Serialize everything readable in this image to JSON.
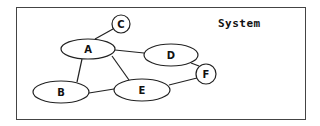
{
  "title": "System",
  "nodes": [
    {
      "id": "A",
      "label": "A",
      "shape": "ellipse",
      "cx": 88,
      "cy": 49,
      "rx": 27,
      "ry": 10
    },
    {
      "id": "B",
      "label": "B",
      "shape": "ellipse",
      "cx": 61,
      "cy": 92,
      "rx": 28,
      "ry": 11
    },
    {
      "id": "C",
      "label": "C",
      "shape": "circle",
      "cx": 121,
      "cy": 24,
      "r": 9
    },
    {
      "id": "D",
      "label": "D",
      "shape": "ellipse",
      "cx": 171,
      "cy": 55,
      "rx": 27,
      "ry": 11
    },
    {
      "id": "E",
      "label": "E",
      "shape": "ellipse",
      "cx": 142,
      "cy": 90,
      "rx": 28,
      "ry": 11
    },
    {
      "id": "F",
      "label": "F",
      "shape": "circle",
      "cx": 206,
      "cy": 74,
      "r": 10
    }
  ],
  "edges": [
    {
      "from": "A",
      "to": "C",
      "x1": 95,
      "y1": 39,
      "x2": 113,
      "y2": 29
    },
    {
      "from": "A",
      "to": "D",
      "x1": 115,
      "y1": 50,
      "x2": 144,
      "y2": 53
    },
    {
      "from": "A",
      "to": "B",
      "x1": 82,
      "y1": 59,
      "x2": 77,
      "y2": 82
    },
    {
      "from": "A",
      "to": "E",
      "x1": 112,
      "y1": 56,
      "x2": 129,
      "y2": 80
    },
    {
      "from": "B",
      "to": "E",
      "x1": 89,
      "y1": 93,
      "x2": 114,
      "y2": 89
    },
    {
      "from": "E",
      "to": "F",
      "x1": 169,
      "y1": 85,
      "x2": 197,
      "y2": 78
    },
    {
      "from": "D",
      "to": "F",
      "x1": 191,
      "y1": 63,
      "x2": 199,
      "y2": 66
    }
  ]
}
